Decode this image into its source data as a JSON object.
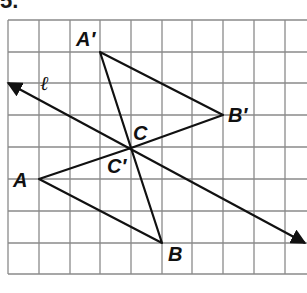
{
  "problem": {
    "number": "5."
  },
  "grid": {
    "left": 8,
    "top": 20,
    "cell": 31.5,
    "cols": 10,
    "rows": 8,
    "line_color": "#8a8a8a"
  },
  "line": {
    "label": "ℓ",
    "from": [
      8,
      83
    ],
    "to": [
      305,
      243
    ],
    "arrows": "both"
  },
  "center": {
    "label": "C",
    "image_label": "C′",
    "x": 131,
    "y": 148
  },
  "preimage": {
    "A": {
      "label": "A",
      "x": 39,
      "y": 179
    },
    "B": {
      "label": "B",
      "x": 162,
      "y": 243
    }
  },
  "image": {
    "A_prime": {
      "label": "A′",
      "x": 100,
      "y": 52
    },
    "B_prime": {
      "label": "B′",
      "x": 223,
      "y": 115
    }
  },
  "ink_color": "#111111"
}
